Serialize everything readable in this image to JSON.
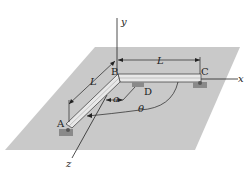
{
  "diagram": {
    "colors": {
      "plane": "#c9c9c9",
      "bar": "#e8e8e8",
      "support": "#8a8a8a",
      "ink": "#222222"
    },
    "axes": {
      "x": "x",
      "y": "y",
      "z": "z"
    },
    "points": {
      "A": "A",
      "B": "B",
      "C": "C",
      "D": "D"
    },
    "dimensions": {
      "L_top": "L",
      "L_left": "L",
      "a": "a",
      "theta": "θ"
    }
  }
}
